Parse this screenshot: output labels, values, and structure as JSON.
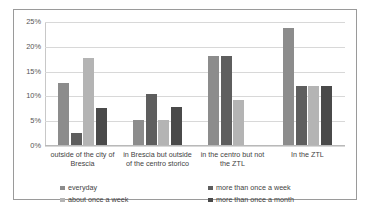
{
  "chart_data": {
    "type": "bar",
    "title": "",
    "xlabel": "",
    "ylabel": "",
    "ylim": [
      0,
      25
    ],
    "ytick_labels": [
      "0%",
      "5%",
      "10%",
      "15%",
      "20%",
      "25%"
    ],
    "ytick_values": [
      0,
      5,
      10,
      15,
      20,
      25
    ],
    "grid": true,
    "legend_position": "bottom",
    "categories": [
      "outside of the city of Brescia",
      "in Brescia but outside of the centro storico",
      "in the centro but not the ZTL",
      "In the ZTL"
    ],
    "series": [
      {
        "name": "everyday",
        "color": "#8c8c8c",
        "values": [
          12.5,
          5.0,
          18.0,
          23.5
        ]
      },
      {
        "name": "more than once a week",
        "color": "#5e5e5e",
        "values": [
          2.5,
          10.2,
          18.0,
          11.8
        ]
      },
      {
        "name": "about once a week",
        "color": "#b4b4b4",
        "values": [
          17.5,
          5.0,
          9.0,
          11.8
        ]
      },
      {
        "name": "more than once a month",
        "color": "#4a4a4a",
        "values": [
          7.5,
          7.6,
          0,
          11.8
        ]
      }
    ]
  },
  "colors": {
    "frame_border": "#9a9a9a",
    "gridline": "#d8d8d8",
    "text": "#3f3f3f"
  }
}
